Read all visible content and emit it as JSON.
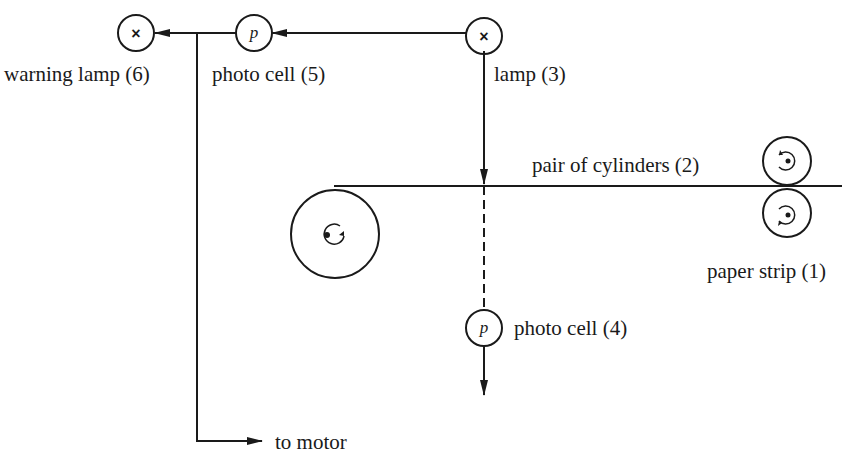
{
  "diagram": {
    "type": "paper strip control system",
    "components": {
      "warning_lamp": {
        "label": "warning lamp (6)",
        "symbol": "×"
      },
      "photo_cell_5": {
        "label": "photo cell (5)",
        "symbol": "p"
      },
      "lamp": {
        "label": "lamp (3)",
        "symbol": "×"
      },
      "cylinders": {
        "label": "pair of cylinders (2)"
      },
      "paper_strip": {
        "label": "paper strip (1)"
      },
      "photo_cell_4": {
        "label": "photo cell (4)",
        "symbol": "p"
      },
      "motor": {
        "label": "to motor"
      }
    },
    "colors": {
      "ink": "#1a1a1a",
      "background": "#ffffff"
    }
  }
}
